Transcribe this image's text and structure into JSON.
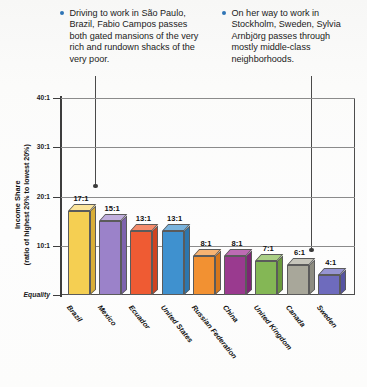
{
  "callouts": [
    {
      "id": "callout-1",
      "bullet_icon": "bullet-dot-icon",
      "text": "Driving to work in São Paulo, Brazil, Fabio Campos passes both gated mansions of the very rich and rundown shacks of the very poor.",
      "points_to": "Brazil"
    },
    {
      "id": "callout-2",
      "bullet_icon": "bullet-dot-icon",
      "text": "On her way to work in Stockholm, Sweden, Sylvia Arnbjörg passes through mostly middle-class neighborhoods.",
      "points_to": "Sweden"
    }
  ],
  "colors": {
    "bullet": "#2f74b5",
    "axis": "#3d3d3d",
    "grid": "#8b8b8b"
  },
  "chart_data": {
    "type": "bar",
    "title": "",
    "xlabel": "",
    "ylabel": "Income Share",
    "ylabel_sub": "(ratio of highest 20% to lowest 20%)",
    "categories": [
      "Brazil",
      "Mexico",
      "Ecuador",
      "United States",
      "Russian Federation",
      "China",
      "United Kingdom",
      "Canada",
      "Sweden"
    ],
    "values": [
      17,
      15,
      13,
      13,
      8,
      8,
      7,
      6,
      4
    ],
    "value_labels": [
      "17:1",
      "15:1",
      "13:1",
      "13:1",
      "8:1",
      "8:1",
      "7:1",
      "6:1",
      "4:1"
    ],
    "bar_colors": [
      "#f5cf52",
      "#9b82c9",
      "#ef5b33",
      "#3f91cf",
      "#f29132",
      "#9a3a8f",
      "#84b755",
      "#a8a79a",
      "#6e6bbd"
    ],
    "bar_side_colors": [
      "#d9ae37",
      "#7e63ae",
      "#cf4321",
      "#2d76ad",
      "#d5761c",
      "#7d2573",
      "#6a9a3c",
      "#8d8c80",
      "#5654a1"
    ],
    "bar_top_colors": [
      "#fbe49b",
      "#c0aedd",
      "#f58b6b",
      "#79b3dd",
      "#f7b372",
      "#bd6bb3",
      "#aacf86",
      "#c6c5bb",
      "#9795d2"
    ],
    "ylim": [
      0,
      40
    ],
    "yticks": [
      0,
      10,
      20,
      30,
      40
    ],
    "ytick_labels": [
      "Equality",
      "10:1",
      "20:1",
      "30:1",
      "40:1"
    ],
    "grid": true,
    "legend": "none"
  }
}
